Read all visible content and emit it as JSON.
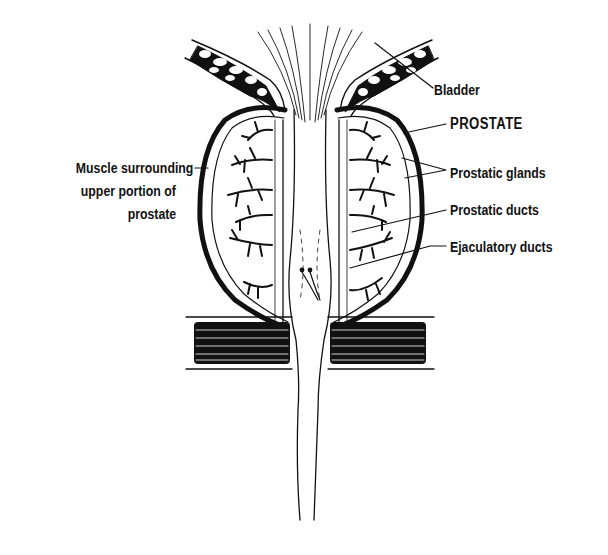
{
  "diagram": {
    "labels": {
      "bladder": "Bladder",
      "prostate": "PROSTATE",
      "prostatic_glands": "Prostatic glands",
      "prostatic_ducts": "Prostatic ducts",
      "ejaculatory_ducts": "Ejaculatory ducts",
      "muscle_line1": "Muscle surrounding",
      "muscle_line2": "upper portion of",
      "muscle_line3": "prostate"
    },
    "colors": {
      "ink": "#111111",
      "background": "#ffffff"
    }
  }
}
